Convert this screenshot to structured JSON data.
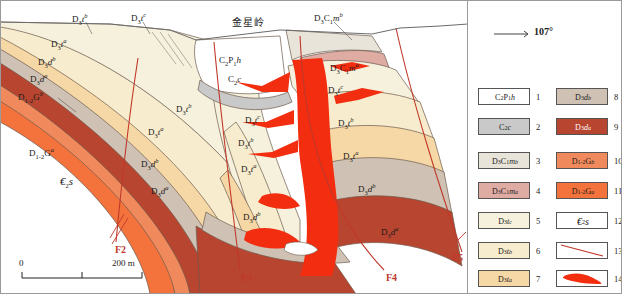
{
  "figure": {
    "peak_label": "金星岭",
    "orientation": {
      "bearing": "107°"
    },
    "scale": {
      "zero": "0",
      "max": "200 m"
    }
  },
  "section_labels": [
    {
      "id": "L1",
      "text": "D3tb",
      "x": 72,
      "y": 14
    },
    {
      "id": "L2",
      "text": "D3tc",
      "x": 131,
      "y": 13
    },
    {
      "id": "L3",
      "text": "D3Cmb",
      "x": 317,
      "y": 13
    },
    {
      "id": "L4",
      "text": "C2P1h",
      "x": 221,
      "y": 57
    },
    {
      "id": "L5",
      "text": "C2c",
      "x": 228,
      "y": 78
    },
    {
      "id": "L6",
      "text": "D3Cma",
      "x": 332,
      "y": 63
    },
    {
      "id": "L7",
      "text": "D3ta",
      "x": 51,
      "y": 39
    },
    {
      "id": "L8",
      "text": "D3db",
      "x": 38,
      "y": 57
    },
    {
      "id": "L9",
      "text": "D3da",
      "x": 30,
      "y": 74
    },
    {
      "id": "L10",
      "text": "D12Gb",
      "x": 20,
      "y": 92
    },
    {
      "id": "L11",
      "text": "D12Ga",
      "x": 31,
      "y": 148
    },
    {
      "id": "L12",
      "text": "C2s",
      "x": 62,
      "y": 178
    },
    {
      "id": "L13",
      "text": "D3tb",
      "x": 176,
      "y": 104
    },
    {
      "id": "L14",
      "text": "D3ta",
      "x": 148,
      "y": 127
    },
    {
      "id": "L15",
      "text": "D3db",
      "x": 141,
      "y": 159
    },
    {
      "id": "L16",
      "text": "D3da",
      "x": 151,
      "y": 186
    },
    {
      "id": "L17",
      "text": "D3tc",
      "x": 245,
      "y": 115
    },
    {
      "id": "L18",
      "text": "D3tb",
      "x": 238,
      "y": 138
    },
    {
      "id": "L19",
      "text": "D3ta",
      "x": 241,
      "y": 164
    },
    {
      "id": "L20",
      "text": "D3db",
      "x": 243,
      "y": 212
    },
    {
      "id": "L21",
      "text": "D3tc",
      "x": 330,
      "y": 85
    },
    {
      "id": "L22",
      "text": "D3tb",
      "x": 340,
      "y": 118
    },
    {
      "id": "L23",
      "text": "D3ta",
      "x": 345,
      "y": 151
    },
    {
      "id": "L24",
      "text": "D3db",
      "x": 360,
      "y": 184
    },
    {
      "id": "L25",
      "text": "D3da",
      "x": 383,
      "y": 227
    },
    {
      "id": "L26",
      "text": "D3tc",
      "x": 222,
      "y": 52
    }
  ],
  "faults": [
    {
      "id": "F2",
      "label": "F2",
      "x": 115,
      "y": 248
    },
    {
      "id": "F3",
      "label": "F3",
      "x": 241,
      "y": 276
    },
    {
      "id": "F4",
      "label": "F4",
      "x": 386,
      "y": 276
    },
    {
      "id": "F5",
      "label": "F5",
      "x": 463,
      "y": 256
    }
  ],
  "legend": {
    "items": [
      {
        "num": "1",
        "text": "C2P1h",
        "color": "#ffffff",
        "col": 0,
        "row": 0
      },
      {
        "num": "2",
        "text": "C2c",
        "color": "#c9c9c9",
        "col": 0,
        "row": 1
      },
      {
        "num": "3",
        "text": "D3Cmb",
        "color": "#e8e4d9",
        "col": 0,
        "row": 2
      },
      {
        "num": "4",
        "text": "D3Cma",
        "color": "#dfaca4",
        "col": 0,
        "row": 3
      },
      {
        "num": "5",
        "text": "D3tc",
        "color": "#f6f1dc",
        "col": 0,
        "row": 4
      },
      {
        "num": "6",
        "text": "D3tb",
        "color": "#f7eccd",
        "col": 0,
        "row": 5
      },
      {
        "num": "7",
        "text": "D3ta",
        "color": "#f6d7a6",
        "col": 0,
        "row": 6
      },
      {
        "num": "8",
        "text": "D3db",
        "color": "#cfc2b4",
        "col": 1,
        "row": 0
      },
      {
        "num": "9",
        "text": "D3da",
        "color": "#b8452f",
        "col": 1,
        "row": 1
      },
      {
        "num": "10",
        "text": "D12Gb",
        "color": "#f08a5d",
        "col": 1,
        "row": 2
      },
      {
        "num": "11",
        "text": "D12Ga",
        "color": "#f4733c",
        "col": 1,
        "row": 3
      },
      {
        "num": "12",
        "text": "C2s",
        "color": "#ffffff",
        "col": 1,
        "row": 4
      },
      {
        "num": "13",
        "text": "",
        "color": "#ffffff",
        "col": 1,
        "row": 5,
        "symbol": "fault-line"
      },
      {
        "num": "14",
        "text": "",
        "color": "#ffffff",
        "col": 1,
        "row": 6,
        "symbol": "intrusive-body"
      }
    ]
  },
  "colors": {
    "C2P1h": "#ffffff",
    "C2c": "#c9c9c9",
    "D3Cmb": "#e8e4d9",
    "D3Cma": "#dfaca4",
    "D3tc": "#f6f1dc",
    "D3tb": "#f7eccd",
    "D3ta": "#f6d7a6",
    "D3db": "#cfc2b4",
    "D3da": "#b8452f",
    "D12Gb": "#f08a5d",
    "D12Ga": "#f4733c",
    "C2s": "#ffffff",
    "intrusive": "#f22d10",
    "fault": "#c0392b",
    "outline": "#6b5a4e"
  }
}
